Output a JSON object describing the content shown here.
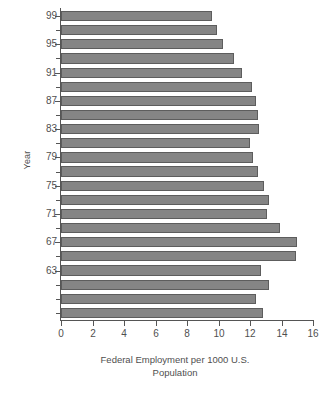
{
  "chart_data": {
    "type": "bar",
    "orientation": "horizontal",
    "title": "",
    "xlabel": "Federal Employment per 1000 U.S. Population",
    "xlabel_line1": "Federal Employment per 1000 U.S.",
    "xlabel_line2": "Population",
    "ylabel": "Year",
    "xlim": [
      0,
      16
    ],
    "ylim_categories_order": "descending-top-to-bottom",
    "grid": false,
    "legend": null,
    "xticks": [
      0,
      2,
      4,
      6,
      8,
      10,
      12,
      14,
      16
    ],
    "xtick_labels": [
      "0",
      "2",
      "4",
      "6",
      "8",
      "10",
      "12",
      "14",
      "16"
    ],
    "ytick_labels": [
      "99",
      "95",
      "91",
      "87",
      "83",
      "79",
      "75",
      "71",
      "67",
      "63"
    ],
    "categories": [
      "99",
      "98",
      "97",
      "96",
      "95",
      "94",
      "93",
      "92",
      "91",
      "90",
      "89",
      "88",
      "87",
      "86",
      "85",
      "84",
      "83",
      "82",
      "81",
      "80",
      "79",
      "78"
    ],
    "values": [
      9.6,
      9.9,
      10.3,
      11.0,
      11.5,
      12.1,
      12.4,
      12.5,
      12.6,
      12.0,
      12.2,
      12.5,
      12.9,
      13.2,
      13.1,
      13.9,
      15.0,
      14.9,
      12.7,
      13.2,
      12.4,
      12.8
    ],
    "bar_color": "#858585",
    "bar_edge_color": "#5d5d5d",
    "axis_color": "#555555",
    "text_color": "#4f4f4f",
    "background": "#ffffff"
  },
  "axes": {
    "y_title": "Year"
  }
}
